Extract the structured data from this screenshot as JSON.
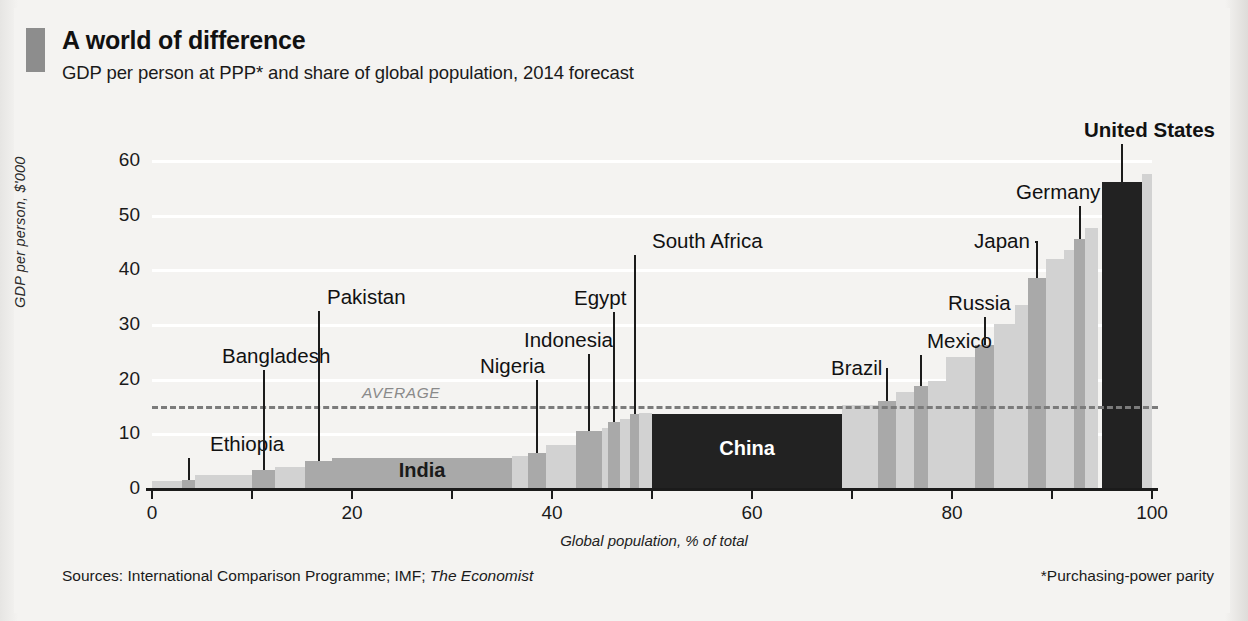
{
  "header": {
    "accent": "#8d8d8d",
    "title": "A world of difference",
    "subtitle": "GDP per person at PPP* and share of global population, 2014 forecast"
  },
  "footer": {
    "sources_prefix": "Sources: International Comparison Programme; IMF; ",
    "sources_italic": "The Economist",
    "note": "*Purchasing-power parity"
  },
  "chart_data": {
    "type": "bar",
    "title": "A world of difference",
    "subtitle": "GDP per person at PPP* and share of global population, 2014 forecast",
    "xlabel": "Global population, % of total",
    "ylabel": "GDP per person, $'000",
    "xlim": [
      0,
      100
    ],
    "ylim": [
      0,
      60
    ],
    "xticks": [
      0,
      10,
      20,
      30,
      40,
      50,
      60,
      70,
      80,
      90,
      100
    ],
    "xticklabels": [
      "0",
      "",
      "20",
      "",
      "40",
      "",
      "60",
      "",
      "80",
      "",
      "100"
    ],
    "yticks": [
      0,
      10,
      20,
      30,
      40,
      50,
      60
    ],
    "yticklabels": [
      "0",
      "10",
      "20",
      "30",
      "40",
      "50",
      "60"
    ],
    "grid": "horizontal-white",
    "legend": "none",
    "x_unit": "cumulative share of global population (%)",
    "y_unit": "GDP per person at PPP, $'000",
    "annotations": [
      {
        "text": "AVERAGE",
        "value": 15,
        "style": "dashed-line"
      }
    ],
    "average_line": 15,
    "bars": [
      {
        "name": "",
        "x0": 0.0,
        "x1": 3.0,
        "value": 1.2,
        "shade": "light",
        "labeled": false
      },
      {
        "name": "Ethiopia",
        "x0": 3.0,
        "x1": 4.3,
        "value": 1.5,
        "shade": "mid",
        "labeled": true,
        "callout": "Ethiopia",
        "callout_x": 196,
        "callout_y": 424,
        "leader": true
      },
      {
        "name": "",
        "x0": 4.3,
        "x1": 10.0,
        "value": 2.3,
        "shade": "light",
        "labeled": false
      },
      {
        "name": "Bangladesh",
        "x0": 10.0,
        "x1": 12.3,
        "value": 3.3,
        "shade": "mid",
        "labeled": true,
        "callout": "Bangladesh",
        "callout_x": 208,
        "callout_y": 336,
        "leader": true
      },
      {
        "name": "",
        "x0": 12.3,
        "x1": 15.3,
        "value": 3.8,
        "shade": "light",
        "labeled": false
      },
      {
        "name": "Pakistan",
        "x0": 15.3,
        "x1": 18.0,
        "value": 5.0,
        "shade": "mid",
        "labeled": true,
        "callout": "Pakistan",
        "callout_x": 313,
        "callout_y": 277,
        "leader": true
      },
      {
        "name": "India",
        "x0": 18.0,
        "x1": 36.0,
        "value": 5.5,
        "shade": "mid",
        "labeled": true,
        "inline_label": "India"
      },
      {
        "name": "",
        "x0": 36.0,
        "x1": 37.6,
        "value": 5.8,
        "shade": "light",
        "labeled": false
      },
      {
        "name": "Nigeria",
        "x0": 37.6,
        "x1": 39.4,
        "value": 6.4,
        "shade": "mid",
        "labeled": true,
        "callout": "Nigeria",
        "callout_x": 466,
        "callout_y": 346,
        "leader": true
      },
      {
        "name": "",
        "x0": 39.4,
        "x1": 42.4,
        "value": 7.8,
        "shade": "light",
        "labeled": false
      },
      {
        "name": "Indonesia",
        "x0": 42.4,
        "x1": 45.0,
        "value": 10.5,
        "shade": "mid",
        "labeled": true,
        "callout": "Indonesia",
        "callout_x": 510,
        "callout_y": 320,
        "leader": true
      },
      {
        "name": "",
        "x0": 45.0,
        "x1": 45.6,
        "value": 11.0,
        "shade": "light",
        "labeled": false
      },
      {
        "name": "Egypt",
        "x0": 45.6,
        "x1": 46.8,
        "value": 12.0,
        "shade": "mid",
        "labeled": true,
        "callout": "Egypt",
        "callout_x": 560,
        "callout_y": 278,
        "leader": true
      },
      {
        "name": "",
        "x0": 46.8,
        "x1": 47.8,
        "value": 12.7,
        "shade": "light",
        "labeled": false
      },
      {
        "name": "South Africa",
        "x0": 47.8,
        "x1": 48.7,
        "value": 13.6,
        "shade": "mid",
        "labeled": true,
        "callout": "South Africa",
        "callout_x": 638,
        "callout_y": 221,
        "leader": true
      },
      {
        "name": "",
        "x0": 48.7,
        "x1": 50.0,
        "value": 13.8,
        "shade": "light",
        "labeled": false
      },
      {
        "name": "China",
        "x0": 50.0,
        "x1": 69.0,
        "value": 13.5,
        "shade": "dark",
        "labeled": true,
        "inline_label": "China"
      },
      {
        "name": "",
        "x0": 69.0,
        "x1": 72.6,
        "value": 15.2,
        "shade": "light",
        "labeled": false
      },
      {
        "name": "Brazil",
        "x0": 72.6,
        "x1": 74.4,
        "value": 16.0,
        "shade": "mid",
        "labeled": true,
        "callout": "Brazil",
        "callout_x": 817,
        "callout_y": 348,
        "leader": true
      },
      {
        "name": "",
        "x0": 74.4,
        "x1": 76.2,
        "value": 17.6,
        "shade": "light",
        "labeled": false
      },
      {
        "name": "Mexico",
        "x0": 76.2,
        "x1": 77.6,
        "value": 18.6,
        "shade": "mid",
        "labeled": true,
        "callout": "Mexico",
        "callout_x": 913,
        "callout_y": 321,
        "leader": true
      },
      {
        "name": "",
        "x0": 77.6,
        "x1": 79.4,
        "value": 19.6,
        "shade": "light",
        "labeled": false
      },
      {
        "name": "",
        "x0": 79.4,
        "x1": 82.3,
        "value": 24.0,
        "shade": "light",
        "labeled": false
      },
      {
        "name": "Russia",
        "x0": 82.3,
        "x1": 84.2,
        "value": 26.2,
        "shade": "mid",
        "labeled": true,
        "callout": "Russia",
        "callout_x": 934,
        "callout_y": 283,
        "leader": true
      },
      {
        "name": "",
        "x0": 84.2,
        "x1": 86.3,
        "value": 30.0,
        "shade": "light",
        "labeled": false
      },
      {
        "name": "",
        "x0": 86.3,
        "x1": 87.6,
        "value": 33.4,
        "shade": "light",
        "labeled": false
      },
      {
        "name": "Japan",
        "x0": 87.6,
        "x1": 89.4,
        "value": 38.5,
        "shade": "mid",
        "labeled": true,
        "callout": "Japan",
        "callout_x": 960,
        "callout_y": 221,
        "leader": true
      },
      {
        "name": "",
        "x0": 89.4,
        "x1": 91.2,
        "value": 41.8,
        "shade": "light",
        "labeled": false
      },
      {
        "name": "",
        "x0": 91.2,
        "x1": 92.2,
        "value": 43.5,
        "shade": "light",
        "labeled": false
      },
      {
        "name": "Germany",
        "x0": 92.2,
        "x1": 93.3,
        "value": 45.6,
        "shade": "mid",
        "labeled": true,
        "callout": "Germany",
        "callout_x": 1002,
        "callout_y": 172,
        "leader": true
      },
      {
        "name": "",
        "x0": 93.3,
        "x1": 94.6,
        "value": 47.5,
        "shade": "light",
        "labeled": false
      },
      {
        "name": "United States",
        "x0": 95.0,
        "x1": 99.0,
        "value": 56.0,
        "shade": "dark",
        "labeled": true,
        "callout": "United States",
        "callout_x": 1070,
        "callout_y": 110,
        "leader": true,
        "bold": true
      },
      {
        "name": "",
        "x0": 99.0,
        "x1": 100.0,
        "value": 57.5,
        "shade": "light",
        "labeled": false
      }
    ]
  }
}
